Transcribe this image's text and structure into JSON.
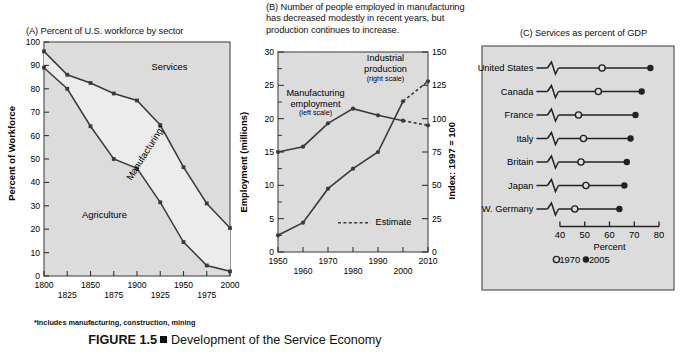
{
  "figure": {
    "number": "FIGURE 1.5",
    "bullet": "square-bullet",
    "caption": "Development of the Service Economy",
    "footnote": "*Includes manufacturing, construction, mining"
  },
  "panelA": {
    "title": "(A) Percent of U.S. workforce by sector",
    "ylabel": "Percent of Workforce",
    "yticks": [
      "0",
      "10",
      "20",
      "30",
      "40",
      "50",
      "60",
      "70",
      "80",
      "90",
      "100"
    ],
    "xticks_top": [
      "1800",
      "1850",
      "1900",
      "1950",
      "2000"
    ],
    "xticks_bottom": [
      "1825",
      "1875",
      "1925",
      "1975"
    ],
    "area_labels": {
      "services": "Services",
      "manufacturing": "Manufacturing*",
      "agriculture": "Agriculture"
    }
  },
  "panelB": {
    "title": "(B) Number of people employed in manufacturing has decreased modestly in recent years, but production continues to increase.",
    "ylabel_left": "Employment (millions)",
    "ylabel_right": "Index: 1997 = 100",
    "yticks_left": [
      "0",
      "5",
      "10",
      "15",
      "20",
      "25",
      "30"
    ],
    "yticks_right": [
      "0",
      "25",
      "50",
      "75",
      "100",
      "125",
      "150"
    ],
    "xticks_top": [
      "1950",
      "1970",
      "1990",
      "2010"
    ],
    "xticks_bottom": [
      "1960",
      "1980",
      "2000"
    ],
    "series_labels": {
      "employment_name": "Manufacturing",
      "employment_name2": "employment",
      "employment_scale": "(left scale)",
      "production_name": "Industrial",
      "production_name2": "production",
      "production_scale": "(right scale)"
    },
    "legend": {
      "estimate": "Estimate"
    }
  },
  "panelC": {
    "title": "(C) Services as percent of GDP",
    "xlabel": "Percent",
    "xticks": [
      "40",
      "50",
      "60",
      "70",
      "80"
    ],
    "legend": {
      "old": "1970",
      "new": "2005"
    }
  },
  "chart_data": [
    {
      "type": "area",
      "panel": "A",
      "title": "(A) Percent of U.S. workforce by sector",
      "xlabel": "",
      "ylabel": "Percent of Workforce",
      "xlim": [
        1800,
        2000
      ],
      "ylim": [
        0,
        100
      ],
      "grid": false,
      "x": [
        1800,
        1825,
        1850,
        1875,
        1900,
        1925,
        1950,
        1975,
        2000
      ],
      "series": [
        {
          "name": "Agriculture (cumulative upper bound = agriculture share)",
          "values": [
            89,
            80,
            64,
            50,
            46,
            31.5,
            14.5,
            4.5,
            2
          ]
        },
        {
          "name": "Agriculture + Manufacturing (cumulative)",
          "values": [
            96,
            86,
            82.5,
            78,
            75,
            64.5,
            46.5,
            31,
            20.5
          ]
        }
      ],
      "annotations": [
        "Services",
        "Manufacturing*",
        "Agriculture"
      ],
      "note": "Band between the two curves is Manufacturing*; above upper curve is Services; below lower curve is Agriculture."
    },
    {
      "type": "line",
      "panel": "B",
      "title": "(B) Number of people employed in manufacturing has decreased modestly in recent years, but production continues to increase.",
      "xlabel": "",
      "ylabel": "Employment (millions)",
      "ylabel_secondary": "Index: 1997 = 100",
      "xlim": [
        1950,
        2010
      ],
      "ylim": [
        0,
        30
      ],
      "ylim_secondary": [
        0,
        150
      ],
      "grid": false,
      "x": [
        1950,
        1960,
        1970,
        1980,
        1990,
        2000,
        2010
      ],
      "series": [
        {
          "name": "Manufacturing employment (left scale)",
          "axis": "left",
          "units": "millions",
          "values": [
            15.0,
            15.8,
            19.3,
            21.5,
            20.5,
            19.7,
            19.0
          ],
          "dashed_from": 2000
        },
        {
          "name": "Industrial production (right scale)",
          "axis": "right",
          "units": "index 1997=100",
          "values": [
            12.5,
            22.0,
            47.5,
            62.5,
            75.0,
            113.0,
            128.0
          ],
          "dashed_from": 2000
        }
      ],
      "legend_position": "inside-lower-center",
      "legend_entries": [
        "Estimate"
      ]
    },
    {
      "type": "scatter",
      "panel": "C",
      "title": "(C) Services as percent of GDP",
      "xlabel": "Percent",
      "ylabel": "",
      "xlim": [
        36,
        82
      ],
      "grid": false,
      "axis_break": true,
      "categories": [
        "United States",
        "Canada",
        "France",
        "Italy",
        "Britain",
        "Japan",
        "W. Germany"
      ],
      "series": [
        {
          "name": "1970",
          "marker": "open-circle",
          "values": [
            57,
            55.5,
            47.5,
            49.5,
            48.5,
            50.5,
            46
          ]
        },
        {
          "name": "2005",
          "marker": "filled-circle",
          "values": [
            76.5,
            73,
            70.5,
            68.5,
            67,
            66,
            64
          ]
        }
      ],
      "legend_position": "below-axis-left"
    }
  ]
}
